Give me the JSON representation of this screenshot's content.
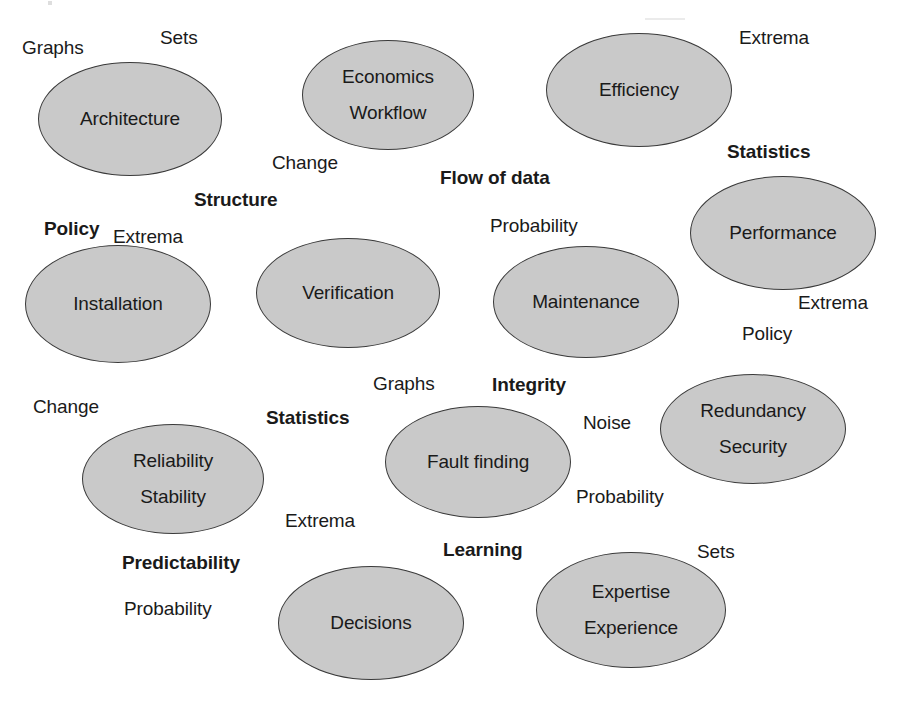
{
  "diagram": {
    "background_color": "#ffffff",
    "node_fill_color": "#c9c9c9",
    "node_stroke_color": "#3a3a3a",
    "text_color": "#1a1a1a"
  },
  "nodes": [
    {
      "id": "architecture",
      "lines": [
        "Architecture"
      ],
      "x": 38,
      "y": 62,
      "w": 184,
      "h": 114
    },
    {
      "id": "economics-workflow",
      "lines": [
        "Economics",
        "Workflow"
      ],
      "x": 302,
      "y": 40,
      "w": 172,
      "h": 110
    },
    {
      "id": "efficiency",
      "lines": [
        "Efficiency"
      ],
      "x": 546,
      "y": 33,
      "w": 186,
      "h": 114
    },
    {
      "id": "performance",
      "lines": [
        "Performance"
      ],
      "x": 690,
      "y": 176,
      "w": 186,
      "h": 114
    },
    {
      "id": "installation",
      "lines": [
        "Installation"
      ],
      "x": 25,
      "y": 245,
      "w": 186,
      "h": 118
    },
    {
      "id": "verification",
      "lines": [
        "Verification"
      ],
      "x": 256,
      "y": 238,
      "w": 184,
      "h": 110
    },
    {
      "id": "maintenance",
      "lines": [
        "Maintenance"
      ],
      "x": 493,
      "y": 246,
      "w": 186,
      "h": 112
    },
    {
      "id": "redundancy-security",
      "lines": [
        "Redundancy",
        "Security"
      ],
      "x": 660,
      "y": 374,
      "w": 186,
      "h": 110
    },
    {
      "id": "reliability-stability",
      "lines": [
        "Reliability",
        "Stability"
      ],
      "x": 82,
      "y": 424,
      "w": 182,
      "h": 110
    },
    {
      "id": "fault-finding",
      "lines": [
        "Fault finding"
      ],
      "x": 385,
      "y": 406,
      "w": 186,
      "h": 112
    },
    {
      "id": "decisions",
      "lines": [
        "Decisions"
      ],
      "x": 278,
      "y": 566,
      "w": 186,
      "h": 114
    },
    {
      "id": "expertise-experience",
      "lines": [
        "Expertise",
        "Experience"
      ],
      "x": 536,
      "y": 552,
      "w": 190,
      "h": 116
    }
  ],
  "labels": [
    {
      "id": "graphs-top-left",
      "text": "Graphs",
      "bold": false,
      "x": 22,
      "y": 38
    },
    {
      "id": "sets-top",
      "text": "Sets",
      "bold": false,
      "x": 160,
      "y": 28
    },
    {
      "id": "extrema-top-right",
      "text": "Extrema",
      "bold": false,
      "x": 739,
      "y": 28
    },
    {
      "id": "change-top",
      "text": "Change",
      "bold": false,
      "x": 272,
      "y": 153
    },
    {
      "id": "flow-of-data",
      "text": "Flow of data",
      "bold": true,
      "x": 440,
      "y": 168
    },
    {
      "id": "statistics-top-right",
      "text": "Statistics",
      "bold": true,
      "x": 727,
      "y": 142
    },
    {
      "id": "structure",
      "text": "Structure",
      "bold": true,
      "x": 194,
      "y": 190
    },
    {
      "id": "policy-left",
      "text": "Policy",
      "bold": true,
      "x": 44,
      "y": 219
    },
    {
      "id": "extrema-left",
      "text": "Extrema",
      "bold": false,
      "x": 113,
      "y": 227
    },
    {
      "id": "probability-mid",
      "text": "Probability",
      "bold": false,
      "x": 490,
      "y": 216
    },
    {
      "id": "extrema-right",
      "text": "Extrema",
      "bold": false,
      "x": 798,
      "y": 293
    },
    {
      "id": "policy-right",
      "text": "Policy",
      "bold": false,
      "x": 742,
      "y": 324
    },
    {
      "id": "graphs-mid",
      "text": "Graphs",
      "bold": false,
      "x": 373,
      "y": 374
    },
    {
      "id": "integrity",
      "text": "Integrity",
      "bold": true,
      "x": 492,
      "y": 375
    },
    {
      "id": "change-left",
      "text": "Change",
      "bold": false,
      "x": 33,
      "y": 397
    },
    {
      "id": "statistics-mid",
      "text": "Statistics",
      "bold": true,
      "x": 266,
      "y": 408
    },
    {
      "id": "noise",
      "text": "Noise",
      "bold": false,
      "x": 583,
      "y": 413
    },
    {
      "id": "probability-lower",
      "text": "Probability",
      "bold": false,
      "x": 576,
      "y": 487
    },
    {
      "id": "extrema-lower",
      "text": "Extrema",
      "bold": false,
      "x": 285,
      "y": 511
    },
    {
      "id": "learning",
      "text": "Learning",
      "bold": true,
      "x": 443,
      "y": 540
    },
    {
      "id": "sets-lower-right",
      "text": "Sets",
      "bold": false,
      "x": 697,
      "y": 542
    },
    {
      "id": "predictability",
      "text": "Predictability",
      "bold": true,
      "x": 122,
      "y": 553
    },
    {
      "id": "probability-bottom",
      "text": "Probability",
      "bold": false,
      "x": 124,
      "y": 599
    }
  ]
}
